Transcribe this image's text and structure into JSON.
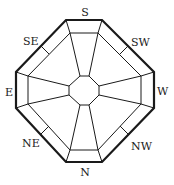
{
  "diagram": {
    "type": "octagonal compass (bagua layout)",
    "labels": {
      "top": "S",
      "top_right": "SW",
      "right": "W",
      "bottom_right": "NW",
      "bottom": "N",
      "bottom_left": "NE",
      "left": "E",
      "top_left": "SE"
    },
    "colors": {
      "stroke": "#1a1a1a",
      "background": "#ffffff",
      "text": "#222222"
    }
  }
}
